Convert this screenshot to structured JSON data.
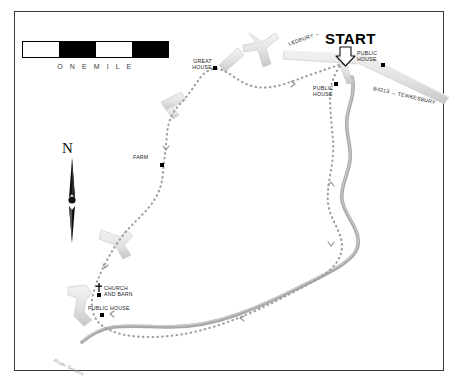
{
  "map": {
    "title": "Walking route map",
    "scale": {
      "label": "O N E     M I L E",
      "segments": [
        "light",
        "dark",
        "light",
        "dark"
      ]
    },
    "compass": {
      "letter": "N",
      "icon": "north-arrow-icon"
    },
    "start": {
      "label": "START",
      "arrow_icon": "down-arrow-icon"
    },
    "labels": [
      {
        "id": "great-house",
        "text": "GREAT\nHOUSE",
        "x": 186,
        "y": 59,
        "class": "lbl-tiny"
      },
      {
        "id": "farm",
        "text": "FARM",
        "x": 133,
        "y": 155,
        "class": "lbl-tiny"
      },
      {
        "id": "church-barn",
        "text": "CHURCH\nAND BARN",
        "x": 104,
        "y": 286,
        "class": "lbl-tiny"
      },
      {
        "id": "public-house-sw",
        "text": "PUBLIC HOUSE",
        "x": 91,
        "y": 306,
        "class": "lbl-tiny"
      },
      {
        "id": "public-house-ne",
        "text": "PUBLIC\nHOUSE",
        "x": 356,
        "y": 53,
        "class": "lbl-tiny"
      },
      {
        "id": "public-house-n",
        "text": "PUBLIC\nHOUSE",
        "x": 313,
        "y": 87,
        "class": "lbl-tiny"
      }
    ],
    "road_labels": {
      "ledbury": "LEDBURY ←",
      "b4213": "B4213 → TEWKESBURY"
    },
    "river_label": "River Severn",
    "markers": [
      {
        "id": "great-house-marker",
        "x": 213,
        "y": 66
      },
      {
        "id": "farm-marker",
        "x": 160,
        "y": 163
      },
      {
        "id": "church-marker",
        "x": 99,
        "y": 293
      },
      {
        "id": "public-house-sw-marker",
        "x": 101,
        "y": 313
      },
      {
        "id": "public-house-ne-marker",
        "x": 381,
        "y": 63
      },
      {
        "id": "public-house-n-marker",
        "x": 334,
        "y": 83
      }
    ],
    "colors": {
      "route": "#9e9e9e",
      "river": "#a8a8a8",
      "road_fill": "#e3e3e3",
      "road_edge": "#bdbdbd",
      "frame": "#3a3a3a",
      "text": "#1a1a1a"
    }
  }
}
